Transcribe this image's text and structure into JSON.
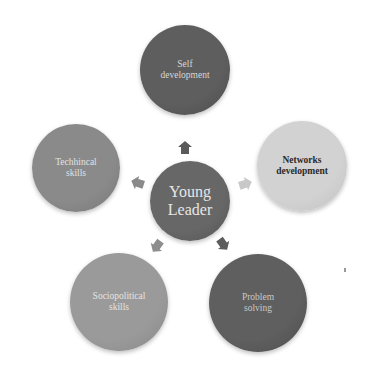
{
  "diagram": {
    "center": {
      "label": "Young\nLeader",
      "fill": "#676767",
      "text_color": "#e6e6e6",
      "cx": 190,
      "cy": 201,
      "r": 40,
      "font_size": 16
    },
    "nodes": [
      {
        "id": "self-development",
        "label": "Self\ndevelopment",
        "fill": "#5e5e5e",
        "text_color": "#d6d6d6",
        "cx": 185,
        "cy": 70,
        "r": 45,
        "font_size": 9.5,
        "bold": false
      },
      {
        "id": "networks-development",
        "label": "Networks\ndevelopment",
        "fill": "#d2d2d2",
        "text_color": "#2a2a2a",
        "cx": 302,
        "cy": 166,
        "r": 45,
        "font_size": 9.5,
        "bold": true
      },
      {
        "id": "problem-solving",
        "label": "Problem\nsolving",
        "fill": "#5f5f5f",
        "text_color": "#c8c8c8",
        "cx": 258,
        "cy": 303,
        "r": 49,
        "font_size": 9.5,
        "bold": false
      },
      {
        "id": "sociopolitical-skills",
        "label": "Sociopolitical\nskills",
        "fill": "#9a9a9a",
        "text_color": "#e4e4e4",
        "cx": 119,
        "cy": 302,
        "r": 49,
        "font_size": 9.5,
        "bold": false
      },
      {
        "id": "technical-skills",
        "label": "Techhincal\nskills",
        "fill": "#8a8a8a",
        "text_color": "#e2e2e2",
        "cx": 76,
        "cy": 168,
        "r": 44,
        "font_size": 9.5,
        "bold": false
      }
    ],
    "arrows": [
      {
        "target": "self-development",
        "x": 185,
        "y": 148,
        "rotate": 0,
        "fill": "#5a5a5a"
      },
      {
        "target": "networks-development",
        "x": 245,
        "y": 184,
        "rotate": 72,
        "fill": "#c8c8c8"
      },
      {
        "target": "problem-solving",
        "x": 223,
        "y": 244,
        "rotate": 144,
        "fill": "#5c5c5c"
      },
      {
        "target": "sociopolitical-skills",
        "x": 157,
        "y": 246,
        "rotate": -144,
        "fill": "#8e8e8e"
      },
      {
        "target": "technical-skills",
        "x": 138,
        "y": 183,
        "rotate": -72,
        "fill": "#8a8a8a"
      }
    ]
  }
}
